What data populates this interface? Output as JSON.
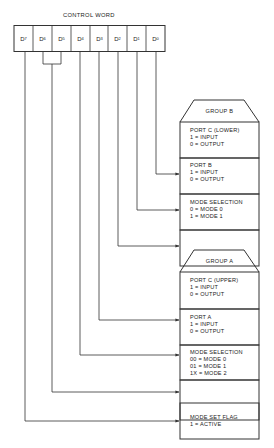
{
  "title": "CONTROL WORD",
  "bits": [
    {
      "name": "D",
      "sub": "7"
    },
    {
      "name": "D",
      "sub": "6"
    },
    {
      "name": "D",
      "sub": "5"
    },
    {
      "name": "D",
      "sub": "4"
    },
    {
      "name": "D",
      "sub": "3"
    },
    {
      "name": "D",
      "sub": "2"
    },
    {
      "name": "D",
      "sub": "1"
    },
    {
      "name": "D",
      "sub": "0"
    }
  ],
  "group_b": {
    "header": "GROUP B",
    "port_c_lower": {
      "title": "PORT C (LOWER)",
      "line1": "1 = INPUT",
      "line2": "0 = OUTPUT"
    },
    "port_b": {
      "title": "PORT B",
      "line1": "1 = INPUT",
      "line2": "0 = OUTPUT"
    },
    "mode_selection": {
      "title": "MODE SELECTION",
      "line1": "0 = MODE 0",
      "line2": "1 = MODE 1"
    }
  },
  "group_a": {
    "header": "GROUP A",
    "port_c_upper": {
      "title": "PORT C (UPPER)",
      "line1": "1 = INPUT",
      "line2": "0 = OUTPUT"
    },
    "port_a": {
      "title": "PORT A",
      "line1": "1 = INPUT",
      "line2": "0 = OUTPUT"
    },
    "mode_selection": {
      "title": "MODE SELECTION",
      "line1": "00 = MODE 0",
      "line2": "01 = MODE 1",
      "line3": "1X = MODE 2"
    }
  },
  "mode_set_flag": {
    "title": "MODE SET FLAG",
    "line1": "1 = ACTIVE"
  },
  "colors": {
    "line": "#333333",
    "background": "#ffffff"
  }
}
